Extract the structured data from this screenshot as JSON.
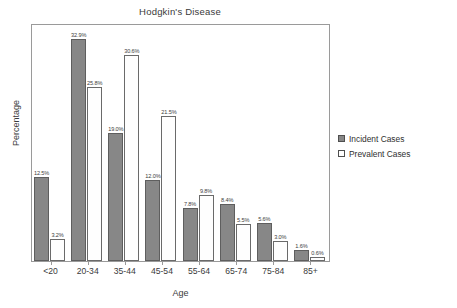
{
  "chart_data": {
    "type": "bar",
    "title": "Hodgkin's Disease",
    "xlabel": "Age",
    "ylabel": "Percentage",
    "categories": [
      "<20",
      "20-34",
      "35-44",
      "45-54",
      "55-64",
      "65-74",
      "75-84",
      "85+"
    ],
    "series": [
      {
        "name": "Incident Cases",
        "color": "#878787",
        "values": [
          12.5,
          32.9,
          19.0,
          12.0,
          7.8,
          8.4,
          5.6,
          1.6
        ],
        "labels": [
          "12.5%",
          "32.9%",
          "19.0%",
          "12.0%",
          "7.8%",
          "8.4%",
          "5.6%",
          "1.6%"
        ]
      },
      {
        "name": "Prevalent Cases",
        "color": "#ffffff",
        "values": [
          3.2,
          25.8,
          30.6,
          21.5,
          9.8,
          5.5,
          3.0,
          0.6
        ],
        "labels": [
          "3.2%",
          "25.8%",
          "30.6%",
          "21.5%",
          "9.8%",
          "5.5%",
          "3.0%",
          "0.6%"
        ]
      }
    ],
    "ylim": [
      0,
      35
    ],
    "grid": false,
    "legend_position": "right"
  },
  "legend": {
    "items": [
      {
        "label": "Incident Cases"
      },
      {
        "label": "Prevalent Cases"
      }
    ]
  }
}
